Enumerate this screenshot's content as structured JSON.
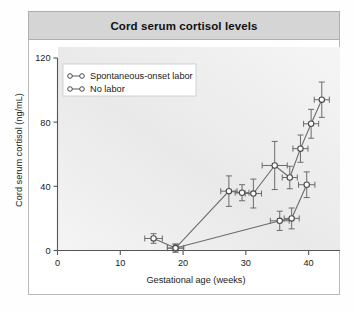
{
  "panel": {
    "title": "Cord serum cortisol levels"
  },
  "chart_data": {
    "type": "line",
    "title": "Cord serum cortisol levels",
    "xlabel": "Gestational age (weeks)",
    "ylabel": "Cord serum cortisol (ng/mL)",
    "xlim": [
      0,
      45
    ],
    "ylim": [
      0,
      120
    ],
    "xticks": [
      0,
      10,
      20,
      30,
      40
    ],
    "xtick_labels": [
      "0",
      "10",
      "20",
      "30",
      "40"
    ],
    "yticks": [
      0,
      40,
      80,
      120
    ],
    "ytick_labels": [
      "0",
      "40",
      "80",
      "120"
    ],
    "grid": false,
    "legend_position": "top-left-inside",
    "marker": "open-circle",
    "error_bars": "x-and-y",
    "series": [
      {
        "name": "Spontaneous-onset labor",
        "points": [
          {
            "x": 15.3,
            "y": 7.5,
            "xerr": 1.4,
            "yerr": 3.0
          },
          {
            "x": 18.8,
            "y": 1.5,
            "xerr": 1.3,
            "yerr": 2.5
          },
          {
            "x": 27.3,
            "y": 37.0,
            "xerr": 1.3,
            "yerr": 9.5
          },
          {
            "x": 29.4,
            "y": 36.0,
            "xerr": 1.1,
            "yerr": 5.0
          },
          {
            "x": 31.2,
            "y": 35.5,
            "xerr": 1.3,
            "yerr": 9.0
          },
          {
            "x": 34.6,
            "y": 53.0,
            "xerr": 2.0,
            "yerr": 15.0
          },
          {
            "x": 37.0,
            "y": 45.5,
            "xerr": 1.2,
            "yerr": 7.0
          },
          {
            "x": 38.7,
            "y": 63.5,
            "xerr": 1.2,
            "yerr": 8.5
          },
          {
            "x": 40.4,
            "y": 79.0,
            "xerr": 1.2,
            "yerr": 9.0
          },
          {
            "x": 42.1,
            "y": 94.0,
            "xerr": 1.2,
            "yerr": 11.0
          }
        ]
      },
      {
        "name": "No labor",
        "points": [
          {
            "x": 18.8,
            "y": 1.5,
            "xerr": 1.3,
            "yerr": 2.5
          },
          {
            "x": 35.4,
            "y": 18.5,
            "xerr": 1.5,
            "yerr": 6.0
          },
          {
            "x": 37.3,
            "y": 20.0,
            "xerr": 1.2,
            "yerr": 6.5
          },
          {
            "x": 39.7,
            "y": 41.0,
            "xerr": 1.3,
            "yerr": 8.0
          }
        ]
      }
    ],
    "legend": [
      {
        "label": "Spontaneous-onset labor"
      },
      {
        "label": "No labor"
      }
    ],
    "colors": {
      "line": "#6b6b6b",
      "marker_fill": "#ffffff",
      "marker_edge": "#4a4a4a",
      "axis": "#555555",
      "plot_background": "#f2f2f2",
      "title_bar": "#d5d5d5"
    }
  }
}
